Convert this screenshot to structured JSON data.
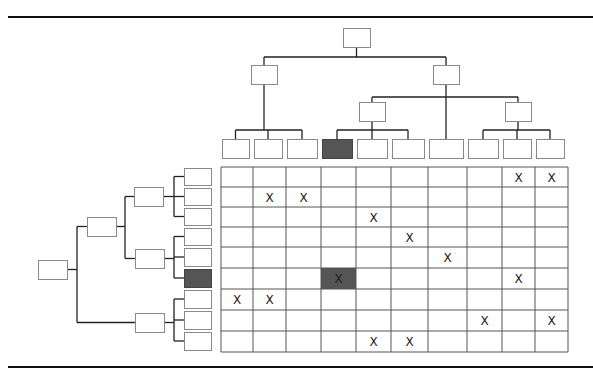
{
  "title": "",
  "rule_color": "#111111",
  "box_stroke": "#8a8a8a",
  "line_color": "#222222",
  "highlight_color": "#555555",
  "mark_symbol": "X",
  "top_tree": {
    "root": {
      "x": 343,
      "y": 28,
      "w": 27,
      "h": 19
    },
    "level1": [
      {
        "x": 221,
        "y": 65,
        "w": 26,
        "h": 19
      },
      {
        "x": 382,
        "y": 65,
        "w": 26,
        "h": 19
      }
    ],
    "level2": [
      {
        "x": 316,
        "y": 102,
        "w": 26,
        "h": 19
      },
      {
        "x": 445,
        "y": 102,
        "w": 26,
        "h": 19
      }
    ],
    "leaves": [
      {
        "x": 196,
        "y": 139,
        "w": 26,
        "h": 19,
        "highlighted": false
      },
      {
        "x": 225,
        "y": 139,
        "w": 26,
        "h": 19,
        "highlighted": false
      },
      {
        "x": 254,
        "y": 139,
        "w": 26,
        "h": 19,
        "highlighted": false
      },
      {
        "x": 286,
        "y": 139,
        "w": 26,
        "h": 19,
        "highlighted": true
      },
      {
        "x": 316,
        "y": 139,
        "w": 26,
        "h": 19,
        "highlighted": false
      },
      {
        "x": 345,
        "y": 139,
        "w": 26,
        "h": 19,
        "highlighted": false
      },
      {
        "x": 382,
        "y": 139,
        "w": 26,
        "h": 19,
        "highlighted": false
      },
      {
        "x": 415,
        "y": 139,
        "w": 26,
        "h": 19,
        "highlighted": false
      },
      {
        "x": 445,
        "y": 139,
        "w": 26,
        "h": 19,
        "highlighted": false
      },
      {
        "x": 475,
        "y": 139,
        "w": 26,
        "h": 19,
        "highlighted": false
      }
    ]
  },
  "left_tree": {
    "root": {
      "x": 38,
      "y": 260,
      "w": 29,
      "h": 19
    },
    "level1": {
      "x": 87,
      "y": 217,
      "w": 29,
      "h": 19
    },
    "level2": [
      {
        "x": 134,
        "y": 187,
        "w": 29,
        "h": 19
      },
      {
        "x": 135,
        "y": 249,
        "w": 29,
        "h": 19
      },
      {
        "x": 135,
        "y": 313,
        "w": 29,
        "h": 19
      }
    ],
    "leaves": [
      {
        "y": 167,
        "highlighted": false
      },
      {
        "y": 188,
        "highlighted": false
      },
      {
        "y": 207,
        "highlighted": false
      },
      {
        "y": 228,
        "highlighted": false
      },
      {
        "y": 248,
        "highlighted": false
      },
      {
        "y": 271,
        "highlighted": true
      },
      {
        "y": 291,
        "highlighted": false
      },
      {
        "y": 312,
        "highlighted": false
      },
      {
        "y": 333,
        "highlighted": false
      }
    ]
  },
  "matrix": {
    "cols": [
      221,
      253,
      286,
      321,
      356,
      391,
      428,
      467,
      502,
      535,
      568
    ],
    "rows": [
      167,
      187,
      207,
      227,
      247,
      268,
      289,
      310,
      331,
      352
    ],
    "marks": [
      [
        0,
        8
      ],
      [
        0,
        9
      ],
      [
        1,
        1
      ],
      [
        1,
        2
      ],
      [
        2,
        4
      ],
      [
        3,
        5
      ],
      [
        4,
        6
      ],
      [
        5,
        3
      ],
      [
        5,
        8
      ],
      [
        6,
        0
      ],
      [
        6,
        1
      ],
      [
        7,
        7
      ],
      [
        7,
        9
      ],
      [
        8,
        4
      ],
      [
        8,
        5
      ]
    ],
    "highlighted_cell": [
      5,
      3
    ]
  }
}
